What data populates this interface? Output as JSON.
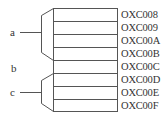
{
  "diagram": {
    "cells": [
      {
        "address": "OXC008"
      },
      {
        "address": "OXC009"
      },
      {
        "address": "OXC00A"
      },
      {
        "address": "OXC00B"
      },
      {
        "address": "OXC00C"
      },
      {
        "address": "OXC00D"
      },
      {
        "address": "OXC00E"
      },
      {
        "address": "OXC00F"
      }
    ],
    "groups": [
      {
        "label": "a",
        "rows": [
          0,
          3
        ]
      },
      {
        "label": "b",
        "rows": [
          4,
          4
        ]
      },
      {
        "label": "c",
        "rows": [
          5,
          7
        ]
      }
    ],
    "colors": {
      "line": "#555555",
      "text": "#333333"
    }
  }
}
